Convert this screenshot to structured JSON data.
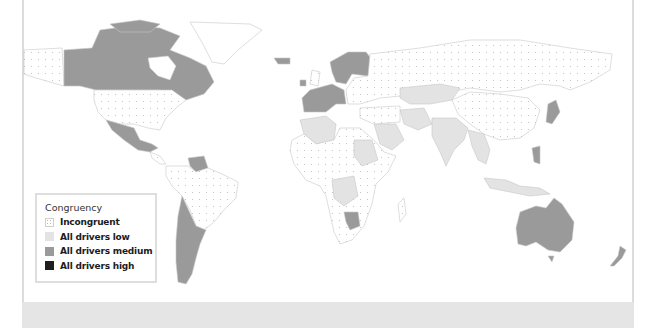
{
  "map": {
    "projection": "world",
    "colors": {
      "incongruent": "#ffffff",
      "incongruent_dot": "#bdbdbd",
      "low": "#e3e3e3",
      "medium": "#9a9a9a",
      "high": "#1e1e1e",
      "border": "#c8c8c8",
      "frame_band": "#e5e5e5"
    },
    "regions": {
      "medium": [
        "Canada",
        "Mexico",
        "Venezuela",
        "Argentina",
        "Chile",
        "Western Europe",
        "Scandinavia",
        "Iceland",
        "Ireland",
        "Botswana",
        "Australia",
        "New Zealand",
        "Japan",
        "Philippines"
      ],
      "low": [
        "Kazakhstan",
        "Iran",
        "Pakistan",
        "India",
        "Saudi Arabia",
        "Algeria",
        "Sudan",
        "Congo",
        "Myanmar",
        "Thailand",
        "Indonesia"
      ],
      "incongruent": [
        "United States",
        "Russia",
        "China",
        "Brazil",
        "Greenland",
        "Alaska",
        "Most of Africa",
        "Eastern Europe"
      ]
    }
  },
  "legend": {
    "title": "Congruency",
    "items": [
      {
        "label": "Incongruent",
        "key": "incongruent"
      },
      {
        "label": "All drivers low",
        "key": "low"
      },
      {
        "label": "All drivers medium",
        "key": "medium"
      },
      {
        "label": "All drivers high",
        "key": "high"
      }
    ]
  }
}
